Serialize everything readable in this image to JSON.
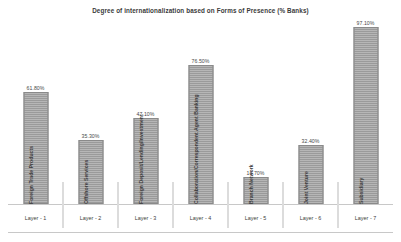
{
  "chart_data": {
    "type": "bar",
    "title": "Degree of internationalization based on Forms of Presence (% Banks)",
    "xlabel": "",
    "ylabel": "",
    "ylim": [
      0,
      100
    ],
    "grid": false,
    "legend": "none",
    "categories": [
      "Foreign Trade Products",
      "Offshore Services",
      "Foreign Deposit/Lending/Investment",
      "Collaboration/Correspondent Agent Banking",
      "Branch Network",
      "Joint Venture",
      "Subsidiary"
    ],
    "values": [
      61.8,
      35.3,
      47.1,
      76.5,
      14.7,
      32.4,
      97.1
    ],
    "value_labels": [
      "61.80%",
      "35.30%",
      "47.10%",
      "76.50%",
      "14.70%",
      "32.40%",
      "97.10%"
    ],
    "group_labels": [
      "Layer - 1",
      "Layer - 2",
      "Layer - 3",
      "Layer - 4",
      "Layer - 5",
      "Layer - 6",
      "Layer - 7"
    ],
    "bar_color": "#9a9a9a",
    "bar_border_color": "#8a8a8a",
    "axis_color": "#c8c8c8",
    "text_color": "#3c3c3c"
  }
}
